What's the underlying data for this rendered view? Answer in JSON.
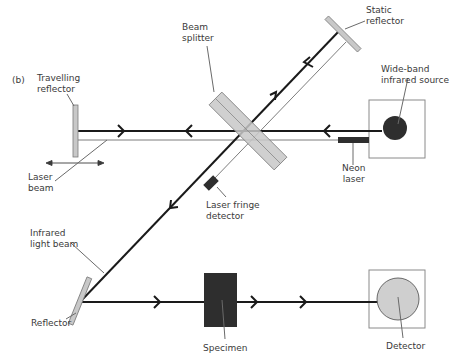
{
  "figure": {
    "panel_label": "(b)",
    "colors": {
      "beam": "#1a1a1a",
      "thin_beam": "#6e6e6e",
      "mirror_fill": "#c8c8c8",
      "mirror_stroke": "#7a7a7a",
      "dark_component": "#2e2e2e",
      "detector_fill": "#cfcfcf",
      "box_stroke": "#8a8a8a",
      "leader": "#6a6a6a",
      "text": "#3a3a3a"
    }
  },
  "labels": {
    "static_reflector": "Static\nreflector",
    "beam_splitter": "Beam\nsplitter",
    "travelling_reflector": "Travelling\nreflector",
    "wide_band_source": "Wide-band\ninfrared source",
    "neon_laser": "Neon\nlaser",
    "laser_beam": "Laser\nbeam",
    "laser_fringe_detector": "Laser fringe\ndetector",
    "infrared_light_beam": "Infrared\nlight beam",
    "reflector": "Reflector",
    "specimen": "Specimen",
    "detector": "Detector"
  },
  "components": [
    {
      "id": "travelling-reflector",
      "type": "mirror",
      "movable": true
    },
    {
      "id": "beam-splitter",
      "type": "beam-splitter"
    },
    {
      "id": "static-reflector",
      "type": "mirror"
    },
    {
      "id": "wide-band-infrared-source",
      "type": "source"
    },
    {
      "id": "neon-laser",
      "type": "laser"
    },
    {
      "id": "laser-fringe-detector",
      "type": "detector"
    },
    {
      "id": "reflector",
      "type": "mirror"
    },
    {
      "id": "specimen",
      "type": "sample"
    },
    {
      "id": "detector",
      "type": "detector"
    }
  ]
}
